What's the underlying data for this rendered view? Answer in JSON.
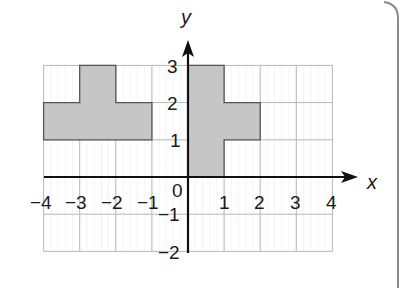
{
  "figure": {
    "x_axis_label": "x",
    "y_axis_label": "y",
    "origin_label": "0",
    "x_tick_labels": [
      "−4",
      "−3",
      "−2",
      "−1",
      "1",
      "2",
      "3",
      "4"
    ],
    "y_tick_labels": [
      "3",
      "2",
      "1",
      "−1",
      "−2"
    ],
    "colors": {
      "grid_line": "#b8b8b8",
      "minor_grid": "#e6e6e6",
      "shape_fill": "#c8c8c8",
      "shape_outline": "#555555",
      "axis": "#111111",
      "frame": "#8a8a8a"
    }
  },
  "chart_data": {
    "type": "grid",
    "title": "",
    "xlabel": "x",
    "ylabel": "y",
    "xlim": [
      -4,
      4
    ],
    "ylim": [
      -2,
      3
    ],
    "grid": true,
    "shapes": [
      {
        "name": "shape-left",
        "cells": [
          [
            -4,
            1
          ],
          [
            -3,
            1
          ],
          [
            -2,
            1
          ],
          [
            -3,
            2
          ]
        ],
        "vertices": [
          [
            -4,
            1
          ],
          [
            -1,
            1
          ],
          [
            -1,
            2
          ],
          [
            -2,
            2
          ],
          [
            -2,
            3
          ],
          [
            -3,
            3
          ],
          [
            -3,
            2
          ],
          [
            -4,
            2
          ]
        ]
      },
      {
        "name": "shape-right",
        "cells": [
          [
            0,
            0
          ],
          [
            0,
            1
          ],
          [
            0,
            2
          ],
          [
            1,
            1
          ]
        ],
        "vertices": [
          [
            0,
            0
          ],
          [
            1,
            0
          ],
          [
            1,
            1
          ],
          [
            2,
            1
          ],
          [
            2,
            2
          ],
          [
            1,
            2
          ],
          [
            1,
            3
          ],
          [
            0,
            3
          ]
        ]
      }
    ]
  }
}
